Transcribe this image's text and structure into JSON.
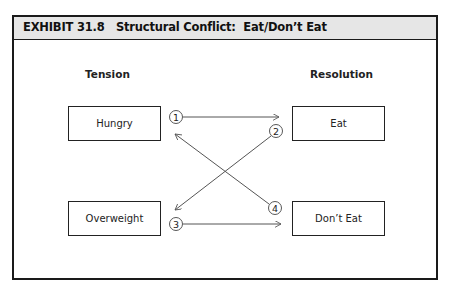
{
  "exhibit": {
    "label": "EXHIBIT 31.8",
    "title": "Structural Conflict:  Eat/Don’t Eat"
  },
  "columns": {
    "tension": "Tension",
    "resolution": "Resolution"
  },
  "nodes": {
    "hungry": "Hungry",
    "overweight": "Overweight",
    "eat": "Eat",
    "dont_eat": "Don’t Eat"
  },
  "connections": [
    {
      "number": "1",
      "from": "Hungry",
      "to": "Eat"
    },
    {
      "number": "2",
      "from": "Eat",
      "to": "Overweight"
    },
    {
      "number": "3",
      "from": "Overweight",
      "to": "Don’t Eat"
    },
    {
      "number": "4",
      "from": "Don’t Eat",
      "to": "Hungry"
    }
  ],
  "colors": {
    "header_bg": "#e6e6e6",
    "line": "#555555",
    "border": "#1a1a1a"
  }
}
